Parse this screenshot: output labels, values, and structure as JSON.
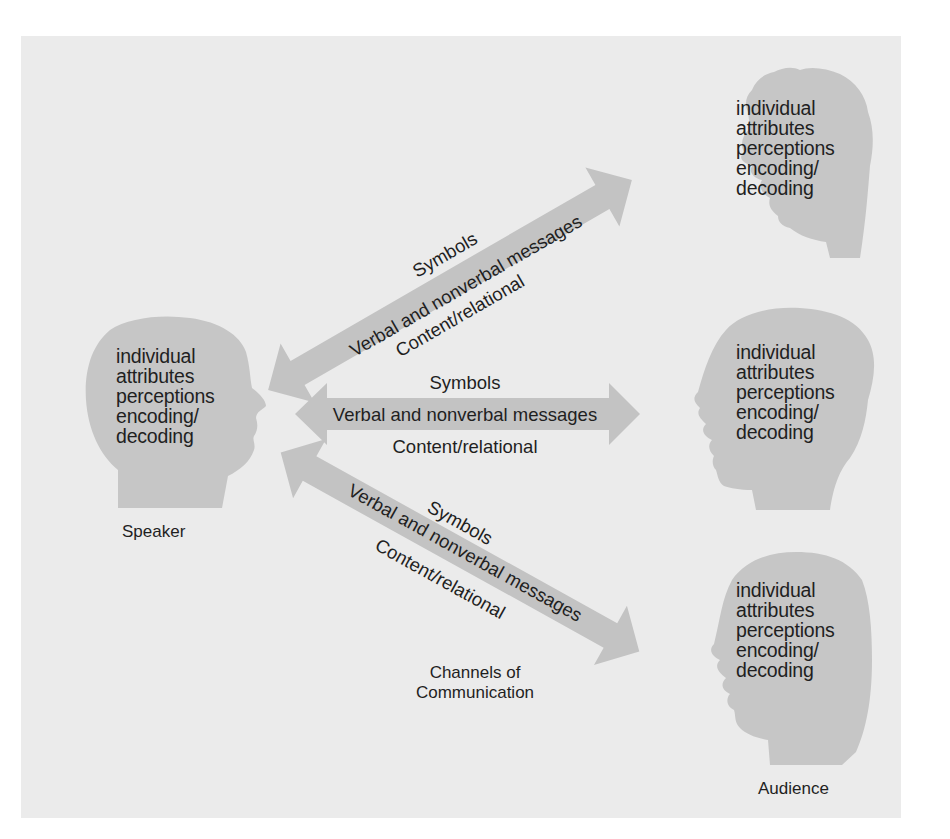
{
  "figure": {
    "colors": {
      "panel_background": "#ebebeb",
      "silhouette": "#c6c6c6",
      "arrow": "#c3c3c3",
      "text": "#1f1f1f"
    }
  },
  "speaker": {
    "label": "Speaker",
    "attributes": [
      "individual",
      "attributes",
      "perceptions",
      "encoding/",
      "decoding"
    ]
  },
  "audience": {
    "label": "Audience",
    "members": [
      {
        "attributes": [
          "individual",
          "attributes",
          "perceptions",
          "encoding/",
          "decoding"
        ]
      },
      {
        "attributes": [
          "individual",
          "attributes",
          "perceptions",
          "encoding/",
          "decoding"
        ]
      },
      {
        "attributes": [
          "individual",
          "attributes",
          "perceptions",
          "encoding/",
          "decoding"
        ]
      }
    ]
  },
  "channels": {
    "caption_line1": "Channels of",
    "caption_line2": "Communication",
    "arrows": [
      {
        "above": "Symbols",
        "on_arrow": "Verbal and nonverbal messages",
        "below": "Content/relational"
      },
      {
        "above": "Symbols",
        "on_arrow": "Verbal and nonverbal messages",
        "below": "Content/relational"
      },
      {
        "above": "Symbols",
        "on_arrow": "Verbal and nonverbal messages",
        "below": "Content/relational"
      }
    ]
  }
}
